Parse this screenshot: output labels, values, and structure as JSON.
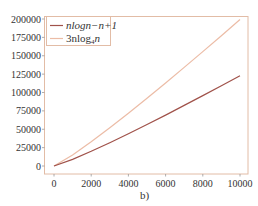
{
  "chart_data": {
    "type": "line",
    "title": "",
    "caption": "b)",
    "xlabel": "",
    "ylabel": "",
    "xlim": [
      0,
      10000
    ],
    "ylim": [
      0,
      200000
    ],
    "grid": false,
    "legend_position": "upper left",
    "x_ticks": [
      0,
      2000,
      4000,
      6000,
      8000,
      10000
    ],
    "y_ticks": [
      0,
      25000,
      50000,
      75000,
      100000,
      125000,
      150000,
      175000,
      200000
    ],
    "x": [
      0,
      1000,
      2000,
      3000,
      4000,
      5000,
      6000,
      7000,
      8000,
      9000,
      10000
    ],
    "series": [
      {
        "name": "nlogn−n+1",
        "color": "#a0524a",
        "values": [
          1,
          8967,
          19933,
          31653,
          43864,
          56440,
          69305,
          82412,
          95727,
          109222,
          122878
        ]
      },
      {
        "name": "3nlog4n",
        "color": "#ecbca6",
        "values": [
          0,
          14949,
          32897,
          51978,
          71795,
          92159,
          112956,
          134117,
          155589,
          177332,
          199316
        ]
      }
    ]
  },
  "legend": {
    "items": [
      {
        "label_main": "nlogn−n+1",
        "label_sub": ""
      },
      {
        "label_prefix": "3nlog",
        "label_sub": "4",
        "label_suffix": "n"
      }
    ]
  },
  "axis": {
    "x_tick_labels": [
      "0",
      "2000",
      "4000",
      "6000",
      "8000",
      "10000"
    ],
    "y_tick_labels": [
      "0",
      "25000",
      "50000",
      "75000",
      "100000",
      "125000",
      "150000",
      "175000",
      "200000"
    ]
  },
  "caption": "b)",
  "colors": {
    "frame": "#e2bca6",
    "dark_line": "#a0524a",
    "light_line": "#ecbca6",
    "text": "#333333"
  }
}
